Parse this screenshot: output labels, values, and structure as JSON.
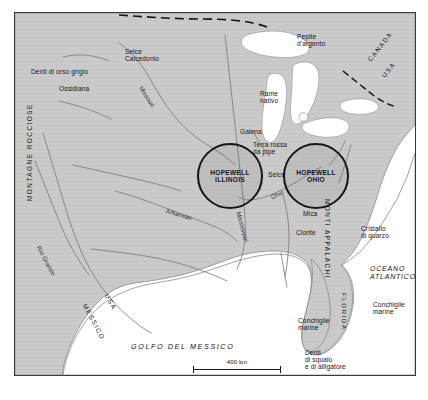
{
  "figure": {
    "kind": "historical-trade-map",
    "colors": {
      "land": "#cacaca",
      "water": "#ffffff",
      "border_frame": "#3a3a3a",
      "river": "#7c7c82",
      "coastline": "#8a8a90",
      "text": "#15151a",
      "site_outline": "#16161a"
    }
  },
  "sites": [
    {
      "id": "hopewell-illinois",
      "line1": "HOPEWELL",
      "line2": "ILLINOIS"
    },
    {
      "id": "hopewell-ohio",
      "line1": "HOPEWELL",
      "line2": "OHIO"
    }
  ],
  "resources": [
    {
      "id": "denti-orso",
      "text": "Denti di orso grigio"
    },
    {
      "id": "ossidiana",
      "text": "Ossidiana"
    },
    {
      "id": "selce-calcedonio",
      "text": "Selce\nCalcedonio"
    },
    {
      "id": "pepite-argento",
      "text": "Pepite\nd'argento"
    },
    {
      "id": "rame-nativo",
      "text": "Rame\nnativo"
    },
    {
      "id": "galena",
      "text": "Galena"
    },
    {
      "id": "terra-rossa",
      "text": "Terra rossa\nda pipe"
    },
    {
      "id": "selce",
      "text": "Selce"
    },
    {
      "id": "mica",
      "text": "Mica"
    },
    {
      "id": "clorite",
      "text": "Clorite"
    },
    {
      "id": "cristallo-quarzo",
      "text": "Cristallo\ndi quarzo"
    },
    {
      "id": "conchiglie-golfo",
      "text": "Conchiglie\nmarine"
    },
    {
      "id": "conchiglie-atl",
      "text": "Conchiglie\nmarine"
    },
    {
      "id": "denti-squalo",
      "text": "Denti\ndi squalo\ne di alligatore"
    }
  ],
  "regions": [
    {
      "id": "montagne-rocciose",
      "text": "MONTAGNE ROCCIOSE"
    },
    {
      "id": "monti-appalachi",
      "text": "MONTI APPALACHI"
    },
    {
      "id": "golfo-messico",
      "text": "GOLFO DEL MESSICO"
    },
    {
      "id": "oceano-atlantico",
      "text": "OCEANO\nATLANTICO"
    },
    {
      "id": "florida",
      "text": "FLORIDA"
    }
  ],
  "countries": [
    {
      "id": "canada",
      "text": "CANADA"
    },
    {
      "id": "usa-nord",
      "text": "USA"
    },
    {
      "id": "usa-sud",
      "text": "USA"
    },
    {
      "id": "messico",
      "text": "MESSICO"
    }
  ],
  "rivers": [
    {
      "id": "missouri",
      "text": "Missouri"
    },
    {
      "id": "mississippi",
      "text": "Mississippi"
    },
    {
      "id": "ohio",
      "text": "Ohio"
    },
    {
      "id": "arkansas",
      "text": "Arkansas"
    },
    {
      "id": "rio-grande",
      "text": "Rio Grande"
    }
  ],
  "scale": {
    "label": "400 km"
  }
}
